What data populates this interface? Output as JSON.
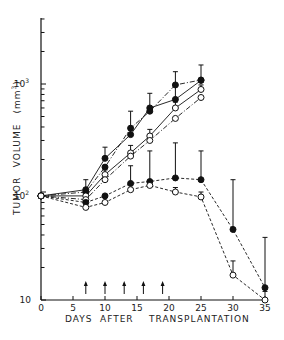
{
  "chart_data": {
    "type": "line",
    "title": "",
    "xlabel": "DAYS AFTER TRANSPLANTATION",
    "ylabel": "TUMOR VOLUME (mm³)",
    "yscale": "log",
    "xlim": [
      0,
      35
    ],
    "ylim": [
      10,
      5000
    ],
    "x_ticks": [
      0,
      5,
      10,
      15,
      20,
      25,
      30,
      35
    ],
    "y_tick_labels": [
      "10",
      "10²",
      "10³"
    ],
    "grid": false,
    "treatment_arrows_days": [
      7,
      10,
      13,
      16,
      19
    ],
    "series": [
      {
        "name": "filled-solid",
        "marker": "filled-circle",
        "line": "solid",
        "x": [
          0,
          7,
          10,
          14,
          17,
          21,
          25
        ],
        "values": [
          92,
          105,
          205,
          340,
          600,
          720,
          1080
        ],
        "error_top": [
          null,
          130,
          260,
          560,
          820,
          1300,
          1500
        ]
      },
      {
        "name": "filled-dashdot",
        "marker": "filled-circle",
        "line": "dashdot",
        "x": [
          0,
          7,
          10,
          14,
          17,
          21,
          25
        ],
        "values": [
          92,
          100,
          170,
          390,
          560,
          980,
          1090
        ],
        "error_top": [
          null,
          null,
          null,
          null,
          null,
          null,
          null
        ]
      },
      {
        "name": "open-solid",
        "marker": "open-circle",
        "line": "solid",
        "x": [
          0,
          7,
          10,
          14,
          17,
          21,
          25
        ],
        "values": [
          92,
          92,
          145,
          230,
          330,
          600,
          890
        ],
        "error_top": [
          null,
          null,
          160,
          270,
          380,
          680,
          980
        ]
      },
      {
        "name": "open-dashdot",
        "marker": "open-circle",
        "line": "dashdot",
        "x": [
          0,
          7,
          10,
          14,
          17,
          21,
          25
        ],
        "values": [
          92,
          85,
          130,
          215,
          300,
          480,
          750
        ],
        "error_top": [
          null,
          null,
          null,
          null,
          null,
          null,
          null
        ]
      },
      {
        "name": "filled-dashed",
        "marker": "filled-circle",
        "line": "dashed",
        "x": [
          0,
          7,
          10,
          14,
          17,
          21,
          25,
          30,
          35
        ],
        "values": [
          92,
          80,
          92,
          120,
          125,
          135,
          130,
          45,
          13
        ],
        "error_top": [
          null,
          null,
          null,
          175,
          240,
          285,
          240,
          130,
          38
        ]
      },
      {
        "name": "open-dashed",
        "marker": "open-circle",
        "line": "dashed",
        "x": [
          0,
          7,
          10,
          14,
          17,
          21,
          25,
          30,
          35
        ],
        "values": [
          92,
          72,
          80,
          105,
          115,
          100,
          90,
          17,
          10
        ],
        "error_top": [
          null,
          null,
          null,
          null,
          125,
          110,
          100,
          23,
          12
        ]
      }
    ]
  },
  "axes": {
    "x_tick_labels": [
      "0",
      "5",
      "10",
      "15",
      "20",
      "25",
      "30",
      "35"
    ],
    "y_tick_labels": [
      "10",
      "10",
      "10"
    ],
    "y_tick_exponents": [
      "",
      "2",
      "3"
    ],
    "xlabel_words": [
      "DAYS",
      "AFTER",
      "TRANSPLANTATION"
    ],
    "ylabel_words": [
      "TUMOR",
      "VOLUME",
      "(mm",
      "3",
      ")"
    ]
  }
}
